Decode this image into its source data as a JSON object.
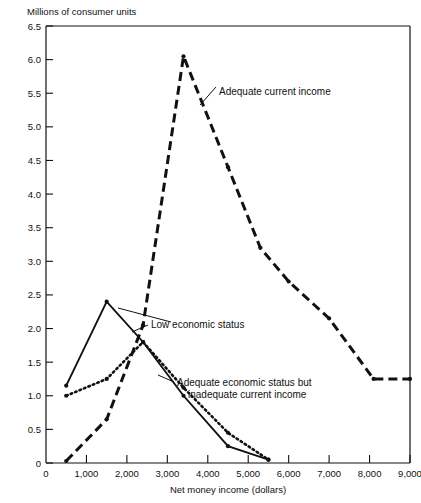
{
  "chart_data": {
    "type": "line",
    "title": "",
    "unit_caption": "Millions of consumer units",
    "xlabel": "Net money income (dollars)",
    "ylabel": "Millions of consumer units",
    "xlim": [
      0,
      9000
    ],
    "ylim": [
      0,
      6.5
    ],
    "grid": false,
    "legend_position": "inline-annotations",
    "x_ticks": [
      0,
      1000,
      2000,
      3000,
      4000,
      5000,
      6000,
      7000,
      8000,
      9000
    ],
    "x_tick_labels": [
      "0",
      "1,000",
      "2,000",
      "3,000",
      "4,000",
      "5,000",
      "6,000",
      "7,000",
      "8,000",
      "9,000"
    ],
    "y_ticks": [
      0,
      0.5,
      1.0,
      1.5,
      2.0,
      2.5,
      3.0,
      3.5,
      4.0,
      4.5,
      5.0,
      5.5,
      6.0,
      6.5
    ],
    "y_tick_labels": [
      "0",
      "0.5",
      "1.0",
      "1.5",
      "2.0",
      "2.5",
      "3.0",
      "3.5",
      "4.0",
      "4.5",
      "5.0",
      "5.5",
      "6.0",
      "6.5"
    ],
    "series": [
      {
        "name": "Adequate current income",
        "style": "dashed",
        "x": [
          500,
          1500,
          2400,
          3400,
          4500,
          5300,
          6000,
          7000,
          8100,
          9000
        ],
        "y": [
          0.03,
          0.65,
          2.05,
          6.05,
          4.4,
          3.2,
          2.7,
          2.15,
          1.25,
          1.25
        ]
      },
      {
        "name": "Low economic status",
        "style": "solid",
        "x": [
          500,
          1500,
          2400,
          3400,
          4500,
          5500
        ],
        "y": [
          1.15,
          2.4,
          1.8,
          1.0,
          0.25,
          0.05
        ]
      },
      {
        "name": "Adequate economic status but inadequate current income",
        "style": "dotted",
        "x": [
          500,
          1500,
          2400,
          3400,
          4500,
          5500
        ],
        "y": [
          1.0,
          1.25,
          1.8,
          1.12,
          0.45,
          0.05
        ]
      }
    ],
    "annotations": [
      {
        "id": "adequate-current-income",
        "text": "Adequate current income",
        "text_x": 219,
        "text_y": 95,
        "leader": [
          [
            216,
            87
          ],
          [
            200,
            105
          ]
        ]
      },
      {
        "id": "low-economic-status",
        "text": "Low economic status",
        "text_x": 151,
        "text_y": 328,
        "leader": [
          [
            148,
            325
          ],
          [
            132,
            332
          ]
        ]
      },
      {
        "id": "low-economic-status-arrow",
        "text": "",
        "text_x": 0,
        "text_y": 0,
        "leader": [
          [
            171,
            322
          ],
          [
            118,
            308
          ]
        ]
      },
      {
        "id": "adequate-economic-status",
        "text": "Adequate economic status but",
        "text_x": 177,
        "text_y": 386,
        "leader": [
          [
            174,
            382
          ],
          [
            158,
            375
          ]
        ]
      },
      {
        "id": "adequate-economic-status-line2",
        "text": "inadequate current income",
        "text_x": 188,
        "text_y": 398,
        "leader": []
      }
    ]
  },
  "figure": {
    "unit_caption": "Millions of consumer units",
    "x_axis_title": "Net money income (dollars)",
    "origin_label": "0"
  },
  "colors": {
    "ink": "#111111",
    "background": "#ffffff"
  }
}
